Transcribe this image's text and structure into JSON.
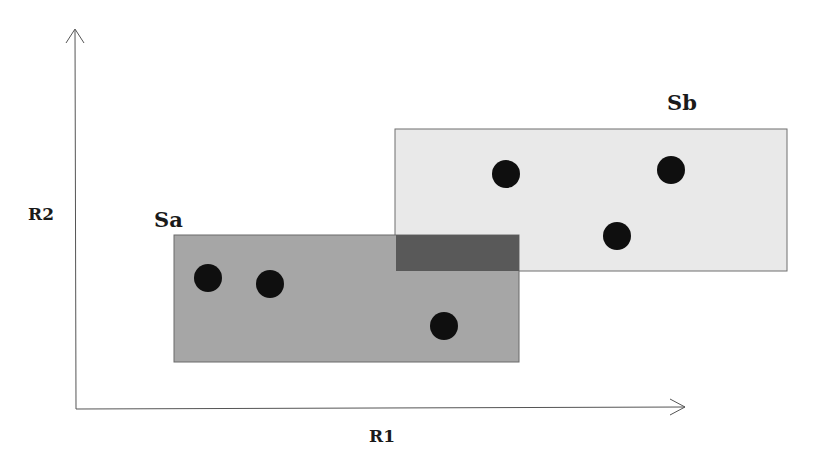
{
  "diagram": {
    "type": "set-overlap-diagram",
    "axes": {
      "x_label": "R1",
      "y_label": "R2"
    },
    "sets": [
      {
        "name": "Sa",
        "label": "Sa",
        "fill": "#a6a6a6",
        "points": 3
      },
      {
        "name": "Sb",
        "label": "Sb",
        "fill": "#e9e9e9",
        "points": 3
      }
    ],
    "overlap": {
      "fill": "#595959"
    },
    "point_color": "#0f0f0f"
  }
}
